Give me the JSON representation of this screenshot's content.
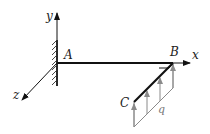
{
  "diagram": {
    "type": "mechanics-cantilever-frame",
    "axes": {
      "x_label": "x",
      "y_label": "y",
      "z_label": "z"
    },
    "points": {
      "fixed_end": "A",
      "corner": "B",
      "free_end": "C"
    },
    "load": {
      "label": "q",
      "kind": "uniformly distributed load",
      "direction": "+y",
      "applied_on": "BC"
    },
    "support": "fixed wall at A",
    "right_angle_at": "B",
    "colors": {
      "structure": "#111111",
      "load": "#8a8a8a",
      "text": "#222222"
    }
  }
}
